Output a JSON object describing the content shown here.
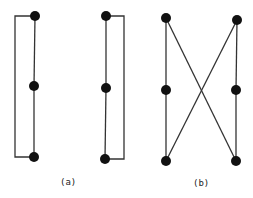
{
  "figure": {
    "labels": {
      "a": "(a)",
      "b": "(b)"
    },
    "line_color": "#333333",
    "node_color": "#111111",
    "graphs": [
      {
        "name": "a-left",
        "nodes": [
          [
            35,
            16
          ],
          [
            34,
            86
          ],
          [
            34,
            157
          ]
        ],
        "edges": [
          [
            0,
            1
          ],
          [
            1,
            2
          ]
        ],
        "bracket": "left"
      },
      {
        "name": "a-right",
        "nodes": [
          [
            106,
            16
          ],
          [
            106,
            88
          ],
          [
            105,
            159
          ]
        ],
        "edges": [
          [
            0,
            1
          ],
          [
            1,
            2
          ]
        ],
        "bracket": "right"
      },
      {
        "name": "b",
        "nodes": [
          [
            166,
            18
          ],
          [
            166,
            90
          ],
          [
            166,
            161
          ],
          [
            237,
            20
          ],
          [
            236,
            90
          ],
          [
            236,
            161
          ]
        ],
        "edges": [
          [
            0,
            1
          ],
          [
            1,
            2
          ],
          [
            3,
            4
          ],
          [
            4,
            5
          ],
          [
            0,
            5
          ],
          [
            3,
            2
          ]
        ]
      }
    ]
  }
}
